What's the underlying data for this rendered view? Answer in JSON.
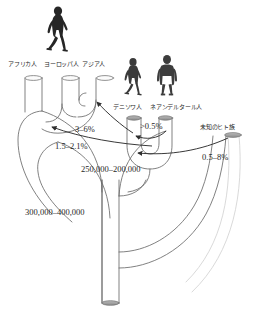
{
  "figure": {
    "type": "human-evolution-admixture-tree",
    "background_color": "#ffffff",
    "line_color": "#5a5a5a",
    "silhouette_color": "#262626"
  },
  "silhouettes": [
    {
      "name": "modern-human-walking",
      "label_group": "modern-humans"
    },
    {
      "name": "denisovan-walking",
      "label_group": "denisovan"
    },
    {
      "name": "neanderthal-standing",
      "label_group": "neanderthal"
    }
  ],
  "tips": [
    {
      "id": "african",
      "label": "アフリカ人"
    },
    {
      "id": "european",
      "label": "ヨーロッパ人"
    },
    {
      "id": "asian",
      "label": "アジア人"
    },
    {
      "id": "denisovan",
      "label": "デニソワ人"
    },
    {
      "id": "neanderthal",
      "label": "ネアンデルタール人"
    },
    {
      "id": "unknown",
      "label": "未知のヒト族"
    }
  ],
  "gene_flow": [
    {
      "id": "denisovan-to-asian",
      "value": "3–6%"
    },
    {
      "id": "neanderthal-to-nonafrican",
      "value": "1.5–2.1%"
    },
    {
      "id": "neanderthal-to-denisovan",
      "value": ">0.5%"
    },
    {
      "id": "unknown-to-denisovan",
      "value": "0.5–8%"
    }
  ],
  "divergence_dates": [
    {
      "id": "denisovan-neanderthal-split",
      "value": "250,000–200,000"
    },
    {
      "id": "modern-archaic-split",
      "value": "300,000–400,000"
    }
  ]
}
